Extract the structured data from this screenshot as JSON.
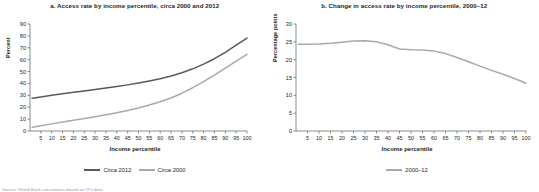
{
  "figure": {
    "source_note": "Source: World Bank calculations based on ITU data."
  },
  "chart_data": [
    {
      "id": "panel-a",
      "type": "line",
      "title": "a. Access rate by income percentile, circa 2000 and 2012",
      "xlabel": "Income percentile",
      "ylabel": "Percent",
      "xlim": [
        0,
        100
      ],
      "ylim": [
        0,
        90
      ],
      "ytick_values": [
        0,
        10,
        20,
        30,
        40,
        50,
        60,
        70,
        80,
        90
      ],
      "ytick_labels": [
        "0",
        "10",
        "20",
        "30",
        "40",
        "50",
        "60",
        "70",
        "80",
        "90"
      ],
      "xtick_values": [
        5,
        10,
        15,
        20,
        25,
        30,
        35,
        40,
        45,
        50,
        55,
        60,
        65,
        70,
        75,
        80,
        85,
        90,
        95,
        100
      ],
      "xtick_labels": [
        "5",
        "10",
        "15",
        "20",
        "25",
        "30",
        "35",
        "40",
        "45",
        "50",
        "55",
        "60",
        "65",
        "70",
        "75",
        "80",
        "85",
        "90",
        "95",
        "100"
      ],
      "grid": false,
      "legend_position": "bottom",
      "x": [
        1,
        5,
        10,
        15,
        20,
        25,
        30,
        35,
        40,
        45,
        50,
        55,
        60,
        65,
        70,
        75,
        80,
        85,
        90,
        95,
        100
      ],
      "series": [
        {
          "name": "Circa 2012",
          "color": "#58595b",
          "values": [
            27.5,
            28.6,
            30.0,
            31.3,
            32.5,
            33.7,
            34.9,
            36.1,
            37.4,
            38.8,
            40.3,
            42.0,
            43.9,
            46.2,
            49.0,
            52.3,
            56.2,
            60.8,
            66.2,
            72.2,
            78.2
          ]
        },
        {
          "name": "Circa 2000",
          "color": "#a7a9ac",
          "values": [
            3.2,
            4.4,
            6.0,
            7.5,
            9.0,
            10.5,
            12.0,
            13.6,
            15.3,
            17.2,
            19.3,
            21.8,
            24.6,
            27.8,
            31.8,
            36.4,
            41.5,
            47.0,
            52.8,
            58.7,
            64.4
          ]
        }
      ]
    },
    {
      "id": "panel-b",
      "type": "line",
      "title": "b. Change in access rate by income percentile, 2000–12",
      "xlabel": "Income percentile",
      "ylabel": "Percentage points",
      "xlim": [
        0,
        100
      ],
      "ylim": [
        0,
        30
      ],
      "ytick_values": [
        0,
        5,
        10,
        15,
        20,
        25,
        30
      ],
      "ytick_labels": [
        "0",
        "5",
        "10",
        "15",
        "20",
        "25",
        "30"
      ],
      "xtick_values": [
        5,
        10,
        15,
        20,
        25,
        30,
        35,
        40,
        45,
        50,
        55,
        60,
        65,
        70,
        75,
        80,
        85,
        90,
        95,
        100
      ],
      "xtick_labels": [
        "5",
        "10",
        "15",
        "20",
        "25",
        "30",
        "35",
        "40",
        "45",
        "50",
        "55",
        "60",
        "65",
        "70",
        "75",
        "80",
        "85",
        "90",
        "95",
        "100"
      ],
      "grid": false,
      "legend_position": "bottom",
      "x": [
        1,
        5,
        10,
        15,
        20,
        25,
        30,
        35,
        40,
        45,
        50,
        55,
        60,
        65,
        70,
        75,
        80,
        85,
        90,
        95,
        100
      ],
      "series": [
        {
          "name": "2000–12",
          "color": "#a7a9ac",
          "values": [
            24.3,
            24.3,
            24.4,
            24.6,
            24.9,
            25.2,
            25.3,
            25.0,
            24.2,
            23.0,
            22.8,
            22.7,
            22.4,
            21.7,
            20.6,
            19.4,
            18.2,
            17.0,
            15.9,
            14.7,
            13.4
          ]
        }
      ]
    }
  ]
}
